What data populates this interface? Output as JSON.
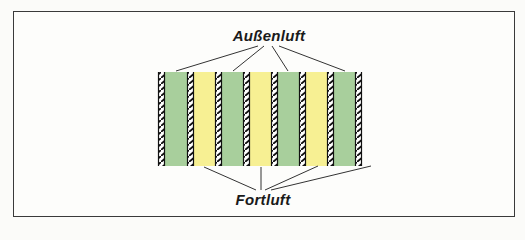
{
  "diagram": {
    "title_top": "Außenluft",
    "title_bottom": "Fortluft",
    "colors": {
      "outdoor_air_channel": "#a8cf9c",
      "exhaust_air_channel": "#f7f093",
      "wall_hatch": "#111111",
      "frame": "#3a3a3a",
      "leader_lines": "#333333"
    },
    "channels": [
      {
        "type": "outdoor_air",
        "color": "green"
      },
      {
        "type": "exhaust_air",
        "color": "yellow"
      },
      {
        "type": "outdoor_air",
        "color": "green"
      },
      {
        "type": "exhaust_air",
        "color": "yellow"
      },
      {
        "type": "outdoor_air",
        "color": "green"
      },
      {
        "type": "exhaust_air",
        "color": "yellow"
      },
      {
        "type": "outdoor_air",
        "color": "green"
      }
    ],
    "wall_count": 8
  }
}
